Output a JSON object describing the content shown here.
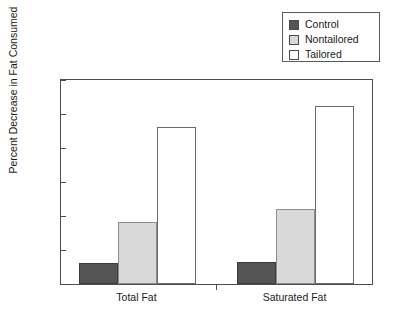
{
  "chart_data": {
    "type": "bar",
    "title": "",
    "xlabel": "",
    "ylabel": "Percent Decrease in Fat Consumed",
    "ylim": [
      0,
      30
    ],
    "yticks": [
      0,
      5,
      10,
      15,
      20,
      25,
      30
    ],
    "grid": false,
    "legend_position": "top-right",
    "categories": [
      "Total Fat",
      "Saturated Fat"
    ],
    "series": [
      {
        "name": "Control",
        "values": [
          3.1,
          3.2
        ],
        "color": "#545454"
      },
      {
        "name": "Nontailored",
        "values": [
          9.1,
          11.1
        ],
        "color": "#d9d9d9"
      },
      {
        "name": "Tailored",
        "values": [
          23.1,
          26.2
        ],
        "color": "#ffffff"
      }
    ]
  },
  "legend": {
    "items": [
      {
        "label": "Control"
      },
      {
        "label": "Nontailored"
      },
      {
        "label": "Tailored"
      }
    ]
  },
  "axes": {
    "y_title": "Percent Decrease in Fat Consumed",
    "y_tick_labels": [
      "30",
      "25",
      "20",
      "15",
      "10",
      "5",
      "0"
    ],
    "x_tick_labels": [
      "Total Fat",
      "Saturated Fat"
    ]
  }
}
